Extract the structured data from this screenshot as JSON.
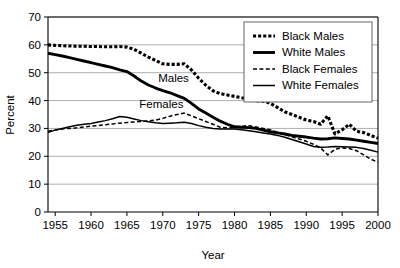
{
  "chart_data": {
    "type": "line",
    "title": "",
    "xlabel": "Year",
    "ylabel": "Percent",
    "xlim": [
      1954,
      2000
    ],
    "ylim": [
      0,
      70
    ],
    "xticks": [
      1955,
      1960,
      1965,
      1970,
      1975,
      1980,
      1985,
      1990,
      1995,
      2000
    ],
    "yticks": [
      0,
      10,
      20,
      30,
      40,
      50,
      60,
      70
    ],
    "grid": "horizontal",
    "legend_position": "top-right",
    "annotations": [
      {
        "text": "Males",
        "x": 1971.5,
        "y": 46.5
      },
      {
        "text": "Females",
        "x": 1969.8,
        "y": 37.2
      }
    ],
    "x": [
      1954,
      1955,
      1956,
      1957,
      1958,
      1959,
      1960,
      1961,
      1962,
      1963,
      1964,
      1965,
      1966,
      1967,
      1968,
      1969,
      1970,
      1971,
      1972,
      1973,
      1974,
      1975,
      1976,
      1977,
      1978,
      1979,
      1980,
      1981,
      1982,
      1983,
      1984,
      1985,
      1986,
      1987,
      1988,
      1989,
      1990,
      1991,
      1992,
      1993,
      1994,
      1995,
      1996,
      1997,
      1998,
      1999,
      2000
    ],
    "series": [
      {
        "name": "Black Males",
        "style": "thick-dotted",
        "color": "#000000",
        "values": [
          60.0,
          59.8,
          59.7,
          59.6,
          59.5,
          59.5,
          59.4,
          59.4,
          59.3,
          59.3,
          59.4,
          59.2,
          58.4,
          57.0,
          55.6,
          54.4,
          53.2,
          53.0,
          53.0,
          53.2,
          51.0,
          48.0,
          45.5,
          43.5,
          42.5,
          42.0,
          41.5,
          41.0,
          40.6,
          40.0,
          39.8,
          39.0,
          37.5,
          36.0,
          35.0,
          34.0,
          33.0,
          32.5,
          31.5,
          34.5,
          28.0,
          29.5,
          31.5,
          29.0,
          28.5,
          27.5,
          26.5
        ]
      },
      {
        "name": "White Males",
        "style": "thick-solid",
        "color": "#000000",
        "values": [
          57.0,
          56.5,
          56.0,
          55.4,
          54.8,
          54.2,
          53.6,
          53.0,
          52.4,
          51.8,
          51.0,
          50.4,
          48.8,
          47.0,
          45.6,
          44.5,
          43.6,
          42.8,
          41.8,
          40.8,
          39.0,
          37.0,
          35.5,
          34.0,
          32.6,
          31.5,
          30.6,
          30.4,
          30.3,
          30.0,
          29.4,
          28.8,
          28.4,
          28.0,
          27.5,
          27.2,
          26.9,
          26.5,
          26.2,
          26.3,
          26.6,
          26.4,
          26.2,
          25.8,
          25.4,
          25.0,
          24.6
        ]
      },
      {
        "name": "Black Females",
        "style": "thin-dashed",
        "color": "#000000",
        "values": [
          29.0,
          29.4,
          29.8,
          30.0,
          30.2,
          30.5,
          30.8,
          31.0,
          31.3,
          31.6,
          31.9,
          32.1,
          32.3,
          32.5,
          32.7,
          33.0,
          33.6,
          34.4,
          35.0,
          35.5,
          34.5,
          33.5,
          32.5,
          31.5,
          30.4,
          30.2,
          30.4,
          30.8,
          31.0,
          30.5,
          30.0,
          29.5,
          28.6,
          27.8,
          27.0,
          26.2,
          25.4,
          24.3,
          23.0,
          20.5,
          22.5,
          23.0,
          22.8,
          22.0,
          20.5,
          19.0,
          17.8
        ]
      },
      {
        "name": "White Females",
        "style": "thin-solid",
        "color": "#000000",
        "values": [
          28.6,
          29.4,
          30.0,
          30.6,
          31.1,
          31.5,
          31.8,
          32.3,
          32.8,
          33.5,
          34.3,
          34.0,
          33.4,
          32.8,
          32.4,
          32.0,
          31.8,
          31.9,
          32.0,
          32.2,
          31.8,
          31.0,
          30.4,
          30.0,
          29.8,
          29.8,
          29.8,
          29.5,
          29.2,
          28.8,
          28.4,
          28.0,
          27.5,
          26.8,
          26.0,
          25.2,
          24.4,
          23.5,
          23.2,
          23.3,
          23.5,
          23.4,
          23.3,
          23.2,
          22.8,
          22.2,
          21.5
        ]
      }
    ]
  },
  "legend": {
    "items": [
      {
        "label": "Black Males",
        "style": "thick-dotted"
      },
      {
        "label": "White Males",
        "style": "thick-solid"
      },
      {
        "label": "Black Females",
        "style": "thin-dashed"
      },
      {
        "label": "White Females",
        "style": "thin-solid"
      }
    ]
  }
}
